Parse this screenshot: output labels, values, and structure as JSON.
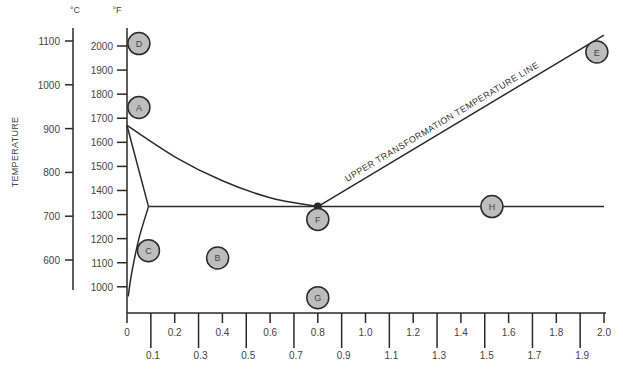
{
  "chart_data": {
    "type": "diagram",
    "title": "",
    "ylabel": "TEMPERATURE",
    "xlabel": "",
    "y_axis_celsius": {
      "unit": "°C",
      "ticks": [
        1100,
        1000,
        900,
        800,
        700,
        600
      ]
    },
    "y_axis_fahrenheit": {
      "unit": "°F",
      "ticks": [
        2000,
        1900,
        1800,
        1700,
        1600,
        1500,
        1400,
        1300,
        1200,
        1100,
        1000
      ],
      "range": [
        920,
        2080
      ]
    },
    "x_axis": {
      "ticks_upper": [
        "0",
        "0.2",
        "0.4",
        "0.6",
        "0.8",
        "1.0",
        "1.2",
        "1.4",
        "1.6",
        "1.8",
        "2.0"
      ],
      "ticks_lower": [
        "0.1",
        "0.3",
        "0.5",
        "0.7",
        "0.9",
        "1.1",
        "1.3",
        "1.5",
        "1.7",
        "1.9"
      ],
      "range": [
        0,
        2.0
      ]
    },
    "curves": {
      "upper_transformation_line_label": "UPPER TRANSFORMATION TEMPERATURE LINE",
      "a3_line": [
        [
          0.0,
          1670
        ],
        [
          0.2,
          1540
        ],
        [
          0.4,
          1440
        ],
        [
          0.6,
          1370
        ],
        [
          0.8,
          1333
        ]
      ],
      "acm_line": [
        [
          0.8,
          1333
        ],
        [
          2.0,
          2045
        ]
      ],
      "a1_line": [
        [
          0.09,
          1333
        ],
        [
          2.0,
          1333
        ]
      ],
      "ferrite_upper": [
        [
          0.0,
          1670
        ],
        [
          0.09,
          1333
        ]
      ],
      "ferrite_lower": [
        [
          0.09,
          1333
        ],
        [
          0.05,
          1200
        ],
        [
          0.02,
          1060
        ],
        [
          0.005,
          960
        ]
      ],
      "eutectoid_point": [
        0.8,
        1333
      ]
    },
    "markers": [
      {
        "label": "D",
        "x": 0.05,
        "y": 2010
      },
      {
        "label": "A",
        "x": 0.05,
        "y": 1745
      },
      {
        "label": "C",
        "x": 0.09,
        "y": 1150
      },
      {
        "label": "B",
        "x": 0.38,
        "y": 1120
      },
      {
        "label": "F",
        "x": 0.8,
        "y": 1280
      },
      {
        "label": "G",
        "x": 0.8,
        "y": 955
      },
      {
        "label": "H",
        "x": 1.53,
        "y": 1333
      },
      {
        "label": "E",
        "x": 1.97,
        "y": 1975
      }
    ],
    "colors": {
      "line": "#2a2a2a",
      "marker_fill": "#bdbdbd",
      "marker_stroke": "#2a2a2a"
    }
  }
}
